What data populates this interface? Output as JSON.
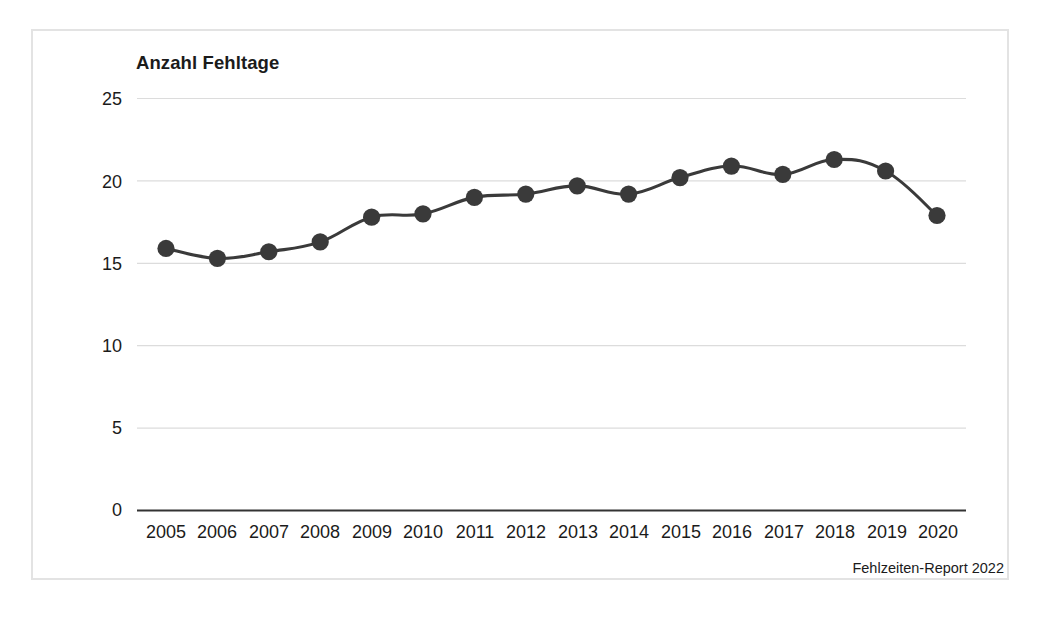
{
  "chart_data": {
    "type": "line",
    "title": "Anzahl Fehltage",
    "xlabel": "",
    "ylabel": "Anzahl Fehltage",
    "categories": [
      "2005",
      "2006",
      "2007",
      "2008",
      "2009",
      "2010",
      "2011",
      "2012",
      "2013",
      "2014",
      "2015",
      "2016",
      "2017",
      "2018",
      "2019",
      "2020"
    ],
    "values": [
      15.9,
      15.3,
      15.7,
      16.3,
      17.8,
      18.0,
      19.0,
      19.2,
      19.7,
      19.2,
      20.2,
      20.9,
      20.4,
      21.3,
      20.6,
      17.9
    ],
    "series": [
      {
        "name": "Anzahl Fehltage",
        "values": [
          15.9,
          15.3,
          15.7,
          16.3,
          17.8,
          18.0,
          19.0,
          19.2,
          19.7,
          19.2,
          20.2,
          20.9,
          20.4,
          21.3,
          20.6,
          17.9
        ]
      }
    ],
    "x": [
      2005,
      2006,
      2007,
      2008,
      2009,
      2010,
      2011,
      2012,
      2013,
      2014,
      2015,
      2016,
      2017,
      2018,
      2019,
      2020
    ],
    "ylim": [
      0,
      25
    ],
    "yticks": [
      0,
      5,
      10,
      15,
      20,
      25
    ],
    "ytick_labels": [
      "0",
      "5",
      "10",
      "15",
      "20",
      "25"
    ],
    "grid": true,
    "grid_axis": "y",
    "legend": false,
    "legend_position": "none",
    "marker": "circle",
    "annotations": [
      "Fehlzeiten-Report 2022"
    ]
  },
  "figure": {
    "axis_title": "Anzahl Fehltage",
    "source_note": "Fehlzeiten-Report 2022"
  },
  "colors": {
    "line": "#3a3a3a",
    "marker": "#3a3a3a",
    "grid": "#dcdcdc",
    "baseline": "#333333",
    "frame": "#e3e3e3",
    "text": "#1b1b1b",
    "background": "#ffffff"
  }
}
